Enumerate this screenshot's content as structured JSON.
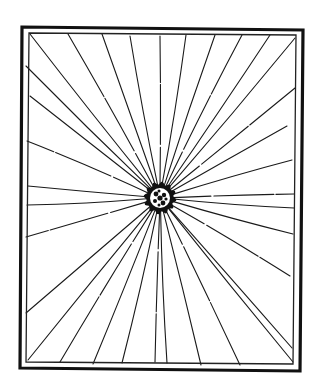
{
  "drawing": {
    "title": "Radiating burst in double-bordered frame",
    "colors": {
      "ink": "#111111",
      "paper": "#ffffff"
    },
    "outer_frame": {
      "tl": [
        22,
        27
      ],
      "tr": [
        303,
        30
      ],
      "br": [
        300,
        371
      ],
      "bl": [
        20,
        368
      ]
    },
    "inner_frame": {
      "tl": [
        29,
        33
      ],
      "tr": [
        296,
        35
      ],
      "br": [
        293,
        364
      ],
      "bl": [
        26,
        362
      ]
    },
    "center": [
      160,
      198
    ],
    "burst_radius": 15,
    "rays": [
      [
        30,
        34
      ],
      [
        68,
        34
      ],
      [
        102,
        34
      ],
      [
        130,
        36
      ],
      [
        160,
        36
      ],
      [
        186,
        35
      ],
      [
        215,
        35
      ],
      [
        242,
        35
      ],
      [
        270,
        35
      ],
      [
        295,
        38
      ],
      [
        295,
        88
      ],
      [
        287,
        126
      ],
      [
        292,
        160
      ],
      [
        294,
        194
      ],
      [
        294,
        208
      ],
      [
        293,
        234
      ],
      [
        290,
        276
      ],
      [
        292,
        348
      ],
      [
        293,
        362
      ],
      [
        240,
        365
      ],
      [
        201,
        365
      ],
      [
        167,
        363
      ],
      [
        155,
        362
      ],
      [
        122,
        363
      ],
      [
        93,
        364
      ],
      [
        60,
        362
      ],
      [
        28,
        360
      ],
      [
        26,
        313
      ],
      [
        26,
        237
      ],
      [
        27,
        205
      ],
      [
        28,
        186
      ],
      [
        27,
        141
      ],
      [
        30,
        96
      ],
      [
        26,
        66
      ]
    ]
  }
}
